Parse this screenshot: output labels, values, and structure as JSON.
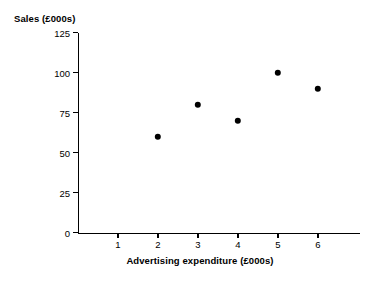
{
  "chart_data": {
    "type": "scatter",
    "title": "",
    "xlabel": "Advertising expenditure (£000s)",
    "ylabel": "Sales (£000s)",
    "x": [
      2,
      3,
      4,
      5,
      6
    ],
    "values": [
      60,
      80,
      70,
      100,
      90
    ],
    "points": [
      {
        "x": 2,
        "y": 60
      },
      {
        "x": 3,
        "y": 80
      },
      {
        "x": 4,
        "y": 70
      },
      {
        "x": 5,
        "y": 100
      },
      {
        "x": 6,
        "y": 90
      }
    ],
    "xlim": [
      0,
      7
    ],
    "ylim": [
      0,
      125
    ],
    "x_ticks": [
      1,
      2,
      3,
      4,
      5,
      6
    ],
    "y_ticks": [
      0,
      25,
      50,
      75,
      100,
      125
    ],
    "x_tick_labels": [
      "1",
      "2",
      "3",
      "4",
      "5",
      "6"
    ],
    "y_tick_labels": [
      "0",
      "25",
      "50",
      "75",
      "100",
      "125"
    ],
    "grid": false,
    "legend": null,
    "marker": "filled-circle",
    "marker_color": "#000000",
    "axis_color": "#000000",
    "background_color": "#ffffff"
  },
  "axes": {
    "y_title": "Sales (£000s)",
    "x_title": "Advertising expenditure (£000s)"
  }
}
